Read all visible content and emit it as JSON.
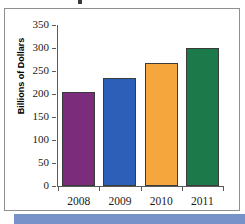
{
  "figure": {
    "frame_border_color": "#8e8e93",
    "background_color": "#ffffff",
    "accent_band_color": "#7792c8"
  },
  "chart_data": {
    "type": "bar",
    "title": "",
    "xlabel": "",
    "ylabel": "Billions of Dollars",
    "categories": [
      "2008",
      "2009",
      "2010",
      "2011"
    ],
    "values": [
      205,
      235,
      268,
      299
    ],
    "ylim": [
      0,
      350
    ],
    "yticks": [
      0,
      50,
      100,
      150,
      200,
      250,
      300,
      350
    ],
    "ytick_labels": [
      "0",
      "50",
      "100",
      "150",
      "200",
      "250",
      "300",
      "350"
    ],
    "grid": false,
    "legend": null,
    "bar_colors": [
      "#7b2d7b",
      "#2e5fb8",
      "#f5a63c",
      "#1c7a4a"
    ],
    "bar_edge_color": "#3b3b3b",
    "series": [
      {
        "name": "Billions of Dollars",
        "values": [
          205,
          235,
          268,
          299
        ]
      }
    ]
  }
}
